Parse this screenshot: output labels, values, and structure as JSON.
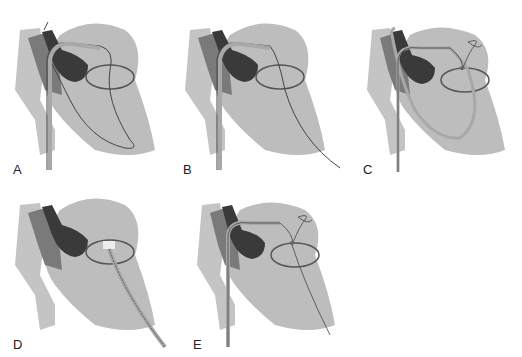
{
  "figure": {
    "colors": {
      "background": "#ffffff",
      "heart_light": "#bdbdbd",
      "vessel_mid": "#9a9a9a",
      "atrium_dark": "#6e6e6e",
      "chamber_darkest": "#3a3a3a",
      "wire": "#444444",
      "catheter": "#a8a8a8",
      "valve_ring": "#555555"
    },
    "panels": [
      {
        "id": "A",
        "label": "A"
      },
      {
        "id": "B",
        "label": "B"
      },
      {
        "id": "C",
        "label": "C"
      },
      {
        "id": "D",
        "label": "D"
      },
      {
        "id": "E",
        "label": "E"
      }
    ]
  }
}
